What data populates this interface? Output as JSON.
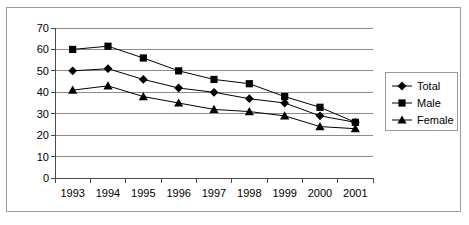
{
  "chart_data": {
    "type": "line",
    "title": "",
    "xlabel": "",
    "ylabel": "",
    "categories": [
      "1993",
      "1994",
      "1995",
      "1996",
      "1997",
      "1998",
      "1999",
      "2000",
      "2001"
    ],
    "yticks": [
      0,
      10,
      20,
      30,
      40,
      50,
      60,
      70
    ],
    "ylim": [
      0,
      70
    ],
    "grid": true,
    "legend_position": "right",
    "series": [
      {
        "name": "Total",
        "marker": "diamond",
        "color": "#000000",
        "values": [
          50,
          51,
          46,
          42,
          40,
          37,
          35,
          29,
          26
        ]
      },
      {
        "name": "Male",
        "marker": "square",
        "color": "#000000",
        "values": [
          60,
          61.5,
          56,
          50,
          46,
          44,
          38,
          33,
          26
        ]
      },
      {
        "name": "Female",
        "marker": "triangle",
        "color": "#000000",
        "values": [
          41,
          43,
          38,
          35,
          32,
          31,
          29,
          24,
          23
        ]
      }
    ]
  },
  "legend": {
    "items": [
      {
        "label": "Total",
        "marker": "diamond"
      },
      {
        "label": "Male",
        "marker": "square"
      },
      {
        "label": "Female",
        "marker": "triangle"
      }
    ]
  }
}
